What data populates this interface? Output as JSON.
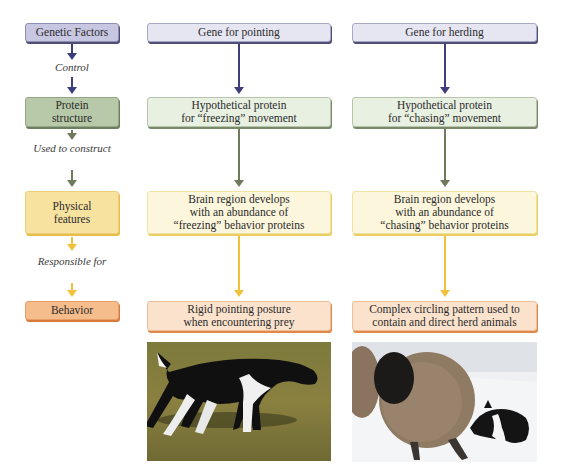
{
  "left_column": {
    "boxes": [
      {
        "label": "Genetic Factors"
      },
      {
        "label": "Protein structure"
      },
      {
        "label": "Physical features"
      },
      {
        "label": "Behavior"
      }
    ],
    "connectors": [
      {
        "label": "Control"
      },
      {
        "label": "Used to construct"
      },
      {
        "label": "Responsible for"
      }
    ]
  },
  "pointing_column": {
    "gene": "Gene for pointing",
    "protein_line1": "Hypothetical protein",
    "protein_line2": "for “freezing” movement",
    "physical_line1": "Brain region develops",
    "physical_line2": "with an abundance of",
    "physical_line3": "“freezing” behavior proteins",
    "behavior_line1": "Rigid pointing posture",
    "behavior_line2": "when encountering prey",
    "photo": "pointing-dog-on-grass"
  },
  "herding_column": {
    "gene": "Gene for herding",
    "protein_line1": "Hypothetical protein",
    "protein_line2": "for “chasing” movement",
    "physical_line1": "Brain region develops",
    "physical_line2": "with an abundance of",
    "physical_line3": "“chasing” behavior proteins",
    "behavior_line1": "Complex circling pattern used to",
    "behavior_line2": "contain and direct herd animals",
    "photo": "border-collie-herding-sheep-in-snow"
  },
  "colors": {
    "gene_arrow": "#3e3e7a",
    "protein_arrow": "#6f7a5c",
    "physical_arrow": "#f0c23c"
  }
}
